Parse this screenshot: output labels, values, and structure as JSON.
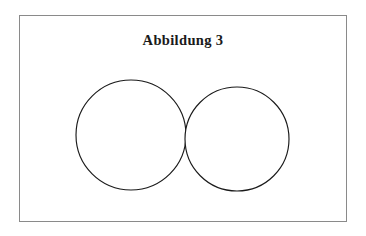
{
  "figure": {
    "caption": "Abbildung 3",
    "caption_number": "3",
    "caption_label": "Abbildung",
    "frame": {
      "border_color": "#8a8a8a",
      "background_color": "#ffffff",
      "x": 19,
      "y": 15,
      "width": 328,
      "height": 207
    }
  },
  "chart_data": {
    "type": "diagram",
    "subtype": "venn-two-circles-tangent",
    "title": "Abbildung 3",
    "xlabel": "",
    "ylabel": "",
    "grid": false,
    "legend": "none",
    "stroke_color": "#1a1a1a",
    "fill_color": "#ffffff",
    "shapes": [
      {
        "name": "left-circle",
        "type": "circle",
        "cx": 111,
        "cy": 119,
        "r": 55,
        "label": ""
      },
      {
        "name": "right-circle",
        "type": "circle",
        "cx": 217,
        "cy": 123,
        "r": 52,
        "label": ""
      }
    ],
    "annotations": []
  }
}
